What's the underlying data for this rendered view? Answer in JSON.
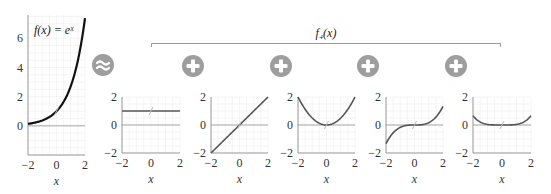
{
  "chart_data": [
    {
      "type": "line",
      "id": "main",
      "title": "f(x) = eˣ",
      "xlabel": "x",
      "ylabel": "",
      "xlim": [
        -2,
        2
      ],
      "ylim": [
        -2,
        7.6
      ],
      "xticks": [
        -2,
        0,
        2
      ],
      "yticks": [
        0,
        2,
        4,
        6
      ],
      "grid": true,
      "series": [
        {
          "name": "e^x",
          "function": "exp(x)",
          "color": "#111111"
        }
      ]
    },
    {
      "type": "line",
      "id": "term0",
      "title": "",
      "xlabel": "x",
      "xlim": [
        -2,
        2
      ],
      "ylim": [
        -2,
        2
      ],
      "xticks": [
        -2,
        0,
        2
      ],
      "yticks": [
        -2,
        0,
        2
      ],
      "grid": true,
      "series": [
        {
          "name": "1",
          "function": "1",
          "color": "#555555"
        }
      ]
    },
    {
      "type": "line",
      "id": "term1",
      "title": "",
      "xlabel": "x",
      "xlim": [
        -2,
        2
      ],
      "ylim": [
        -2,
        2
      ],
      "xticks": [
        -2,
        0,
        2
      ],
      "yticks": [
        -2,
        0,
        2
      ],
      "grid": true,
      "series": [
        {
          "name": "x",
          "function": "x",
          "color": "#555555"
        }
      ]
    },
    {
      "type": "line",
      "id": "term2",
      "title": "",
      "xlabel": "x",
      "xlim": [
        -2,
        2
      ],
      "ylim": [
        -2,
        2
      ],
      "xticks": [
        -2,
        0,
        2
      ],
      "yticks": [
        -2,
        0,
        2
      ],
      "grid": true,
      "series": [
        {
          "name": "x^2/2",
          "function": "x^2/2",
          "color": "#555555"
        }
      ]
    },
    {
      "type": "line",
      "id": "term3",
      "title": "",
      "xlabel": "x",
      "xlim": [
        -2,
        2
      ],
      "ylim": [
        -2,
        2
      ],
      "xticks": [
        -2,
        0,
        2
      ],
      "yticks": [
        -2,
        0,
        2
      ],
      "grid": true,
      "series": [
        {
          "name": "x^3/6",
          "function": "x^3/6",
          "color": "#555555"
        }
      ]
    },
    {
      "type": "line",
      "id": "term4",
      "title": "",
      "xlabel": "x",
      "xlim": [
        -2,
        2
      ],
      "ylim": [
        -2,
        2
      ],
      "xticks": [
        -2,
        0,
        2
      ],
      "yticks": [
        -2,
        0,
        2
      ],
      "grid": true,
      "series": [
        {
          "name": "x^4/24",
          "function": "x^4/24",
          "color": "#555555"
        }
      ]
    }
  ],
  "bracket_label": "f₄(x)",
  "operators": {
    "approx": "≈",
    "plus": "+"
  },
  "colors": {
    "operator_circle": "#9e9e9e",
    "operator_glyph": "#ffffff",
    "axis": "#9a9a9a",
    "zero_line": "#a8a8a8",
    "grid": "#efefef",
    "bracket": "#9a9a9a"
  }
}
